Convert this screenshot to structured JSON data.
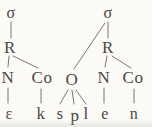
{
  "diagram": {
    "type": "syllable-structure-tree",
    "word_segments": "ε k s p l e n",
    "nodes": [
      {
        "id": "sigma1",
        "label": "σ",
        "role": "syllable"
      },
      {
        "id": "R1",
        "label": "R",
        "role": "rhyme"
      },
      {
        "id": "N1",
        "label": "N",
        "role": "nucleus"
      },
      {
        "id": "Co1",
        "label": "Co",
        "role": "coda"
      },
      {
        "id": "eps",
        "label": "ε",
        "role": "segment"
      },
      {
        "id": "k",
        "label": "k",
        "role": "segment"
      },
      {
        "id": "sigma2",
        "label": "σ",
        "role": "syllable"
      },
      {
        "id": "O",
        "label": "O",
        "role": "onset"
      },
      {
        "id": "R2",
        "label": "R",
        "role": "rhyme"
      },
      {
        "id": "N2",
        "label": "N",
        "role": "nucleus"
      },
      {
        "id": "Co2",
        "label": "Co",
        "role": "coda"
      },
      {
        "id": "s",
        "label": "s",
        "role": "segment"
      },
      {
        "id": "p",
        "label": "p",
        "role": "segment"
      },
      {
        "id": "l",
        "label": "l",
        "role": "segment"
      },
      {
        "id": "e",
        "label": "e",
        "role": "segment"
      },
      {
        "id": "n",
        "label": "n",
        "role": "segment"
      }
    ],
    "edges": [
      [
        "sigma1",
        "R1"
      ],
      [
        "R1",
        "N1"
      ],
      [
        "R1",
        "Co1"
      ],
      [
        "N1",
        "eps"
      ],
      [
        "Co1",
        "k"
      ],
      [
        "sigma2",
        "R2"
      ],
      [
        "sigma2",
        "O"
      ],
      [
        "R2",
        "N2"
      ],
      [
        "R2",
        "Co2"
      ],
      [
        "O",
        "s"
      ],
      [
        "O",
        "p"
      ],
      [
        "O",
        "l"
      ],
      [
        "N2",
        "e"
      ],
      [
        "Co2",
        "n"
      ]
    ]
  },
  "colors": {
    "ink": "#4a4744",
    "line": "#7b7872",
    "background": "#fbfaf7"
  }
}
